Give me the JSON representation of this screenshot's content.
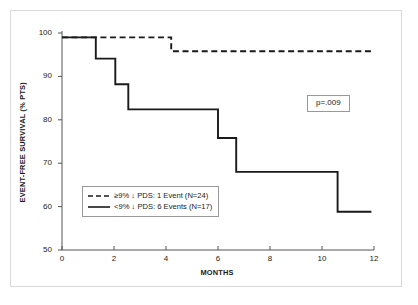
{
  "chart_data": {
    "type": "line",
    "title": "",
    "xlabel": "MONTHS",
    "ylabel": "EVENT-FREE SURVIVAL (% PTS)",
    "xlim": [
      0,
      12
    ],
    "ylim": [
      50,
      100
    ],
    "xticks": [
      "0",
      "2",
      "4",
      "6",
      "8",
      "10",
      "12"
    ],
    "xtick_values": [
      0,
      2,
      4,
      6,
      8,
      10,
      12
    ],
    "yticks": [
      "50",
      "60",
      "70",
      "80",
      "90",
      "100"
    ],
    "ytick_values": [
      50,
      60,
      70,
      80,
      90,
      100
    ],
    "grid": false,
    "legend_position": "lower left",
    "annotations": [
      {
        "name": "p-value",
        "text": "p=.009"
      }
    ],
    "series": [
      {
        "name": "≥9% ↓ PDS: 1 Event (N=24)",
        "label": "≥9% ↓ PDS: 1 Event (N=24)",
        "style": "dashed",
        "color": "#1a1a1a",
        "n": 24,
        "events": 1,
        "steps": [
          {
            "x": 0.0,
            "y": 99.0
          },
          {
            "x": 4.2,
            "y": 99.0
          },
          {
            "x": 4.2,
            "y": 95.8
          },
          {
            "x": 12.0,
            "y": 95.8
          }
        ]
      },
      {
        "name": "<9% ↓ PDS: 6 Events (N=17)",
        "label": "<9% ↓ PDS: 6 Events (N=17)",
        "style": "solid",
        "color": "#1a1a1a",
        "n": 17,
        "events": 6,
        "steps": [
          {
            "x": 0.0,
            "y": 99.0
          },
          {
            "x": 1.3,
            "y": 99.0
          },
          {
            "x": 1.3,
            "y": 94.1
          },
          {
            "x": 2.05,
            "y": 94.1
          },
          {
            "x": 2.05,
            "y": 88.2
          },
          {
            "x": 2.55,
            "y": 88.2
          },
          {
            "x": 2.55,
            "y": 82.4
          },
          {
            "x": 6.0,
            "y": 82.4
          },
          {
            "x": 6.0,
            "y": 75.8
          },
          {
            "x": 6.7,
            "y": 75.8
          },
          {
            "x": 6.7,
            "y": 68.0
          },
          {
            "x": 10.6,
            "y": 68.0
          },
          {
            "x": 10.6,
            "y": 58.8
          },
          {
            "x": 11.9,
            "y": 58.8
          }
        ]
      }
    ]
  },
  "legend": {
    "entries": [
      {
        "label": "≥9% ↓ PDS: 1 Event (N=24)",
        "style": "dashed"
      },
      {
        "label": "<9% ↓ PDS: 6 Events (N=17)",
        "style": "solid"
      }
    ]
  },
  "pvalue": {
    "text": "p=.009"
  },
  "colors": {
    "line": "#1a1a1a",
    "axis": "#555555",
    "frame": "#d9d9d9",
    "box_border": "#999999",
    "background": "#ffffff"
  }
}
